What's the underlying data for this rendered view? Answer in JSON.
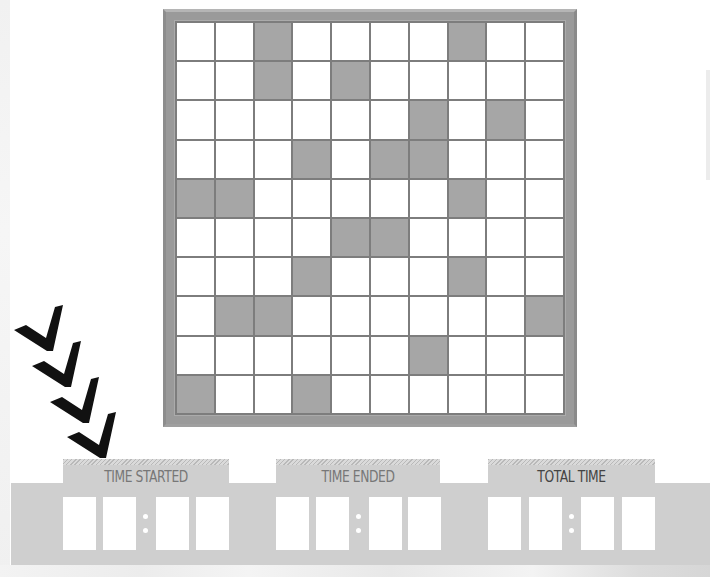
{
  "puzzle": {
    "rows": 10,
    "cols": 10,
    "shaded_color": "#a6a6a6",
    "empty_color": "#ffffff",
    "frame_color": "#9a9a9a",
    "shaded_cells": [
      [
        2,
        7
      ],
      [
        2,
        4
      ],
      [
        6,
        8
      ],
      [
        3,
        5,
        6
      ],
      [
        0,
        1,
        7
      ],
      [
        4,
        5
      ],
      [
        3,
        7
      ],
      [
        1,
        2,
        9
      ],
      [
        6
      ],
      [
        0,
        3
      ]
    ]
  },
  "arrows": {
    "count": 4,
    "icon": "chevron-down-right-icon",
    "color": "#111111"
  },
  "timers": [
    {
      "label": "TIME STARTED",
      "digits": [
        "",
        "",
        "",
        ""
      ],
      "separator": ":"
    },
    {
      "label": "TIME ENDED",
      "digits": [
        "",
        "",
        "",
        ""
      ],
      "separator": ":"
    },
    {
      "label": "TOTAL TIME",
      "digits": [
        "",
        "",
        "",
        ""
      ],
      "separator": ":"
    }
  ]
}
